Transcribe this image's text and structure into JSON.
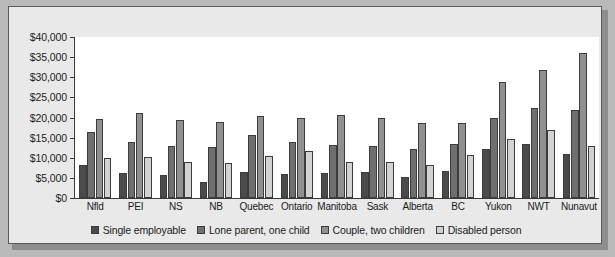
{
  "chart_data": {
    "type": "bar",
    "title": "",
    "xlabel": "",
    "ylabel": "",
    "ylim": [
      0,
      40000
    ],
    "ytick_labels": [
      "$40,000",
      "$35,000",
      "$30,000",
      "$25,000",
      "$20,000",
      "$15,000",
      "$10,000",
      "$5,000",
      "$0"
    ],
    "ytick_values": [
      40000,
      35000,
      30000,
      25000,
      20000,
      15000,
      10000,
      5000,
      0
    ],
    "grid": false,
    "legend_position": "bottom",
    "categories": [
      "Nfld",
      "PEI",
      "NS",
      "NB",
      "Quebec",
      "Ontario",
      "Manitoba",
      "Sask",
      "Alberta",
      "BC",
      "Yukon",
      "NWT",
      "Nunavut"
    ],
    "series": [
      {
        "name": "Single employable",
        "color": "#4b4b4b",
        "values": [
          8300,
          6200,
          5700,
          4000,
          6400,
          6000,
          6100,
          6400,
          5200,
          6700,
          12300,
          13300,
          11000
        ]
      },
      {
        "name": "Lone parent, one child",
        "color": "#6f6f6f",
        "values": [
          16300,
          13800,
          13000,
          12700,
          15700,
          13800,
          13200,
          13000,
          12300,
          13300,
          19900,
          22300,
          21900
        ]
      },
      {
        "name": "Couple, two children",
        "color": "#909090",
        "values": [
          19700,
          21000,
          19400,
          18900,
          20300,
          20000,
          20700,
          19800,
          18600,
          18700,
          28800,
          31800,
          36000
        ]
      },
      {
        "name": "Disabled person",
        "color": "#d2d2d2",
        "values": [
          9900,
          10100,
          9000,
          8600,
          10500,
          11800,
          9000,
          9000,
          8200,
          10800,
          14600,
          17000,
          13000
        ]
      }
    ]
  }
}
